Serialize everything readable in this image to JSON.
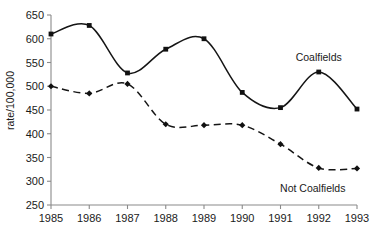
{
  "chart_data": {
    "type": "line",
    "title": "",
    "xlabel": "",
    "ylabel": "rate/100,000",
    "x": [
      1985,
      1986,
      1987,
      1988,
      1989,
      1990,
      1991,
      1992,
      1993
    ],
    "xtick_labels": [
      "1985",
      "1986",
      "1987",
      "1988",
      "1989",
      "1990",
      "1991",
      "1992",
      "1993"
    ],
    "ytick_labels": [
      "250",
      "300",
      "350",
      "400",
      "450",
      "500",
      "550",
      "600",
      "650"
    ],
    "yticks": [
      250,
      300,
      350,
      400,
      450,
      500,
      550,
      600,
      650
    ],
    "ylim": [
      250,
      650
    ],
    "xlim": [
      1985,
      1993
    ],
    "grid": false,
    "legend_position": "inline-annotations",
    "series": [
      {
        "name": "Coalfields",
        "style": "solid",
        "marker": "square",
        "label_text": "Coalfields",
        "values": [
          610,
          628,
          528,
          578,
          600,
          487,
          455,
          530,
          452
        ]
      },
      {
        "name": "Not Coalfields",
        "style": "dashed",
        "marker": "diamond",
        "label_text": "Not Coalfields",
        "values": [
          500,
          485,
          505,
          420,
          418,
          418,
          378,
          328,
          327
        ]
      }
    ],
    "annotations": [
      {
        "text": "Coalfields",
        "series": "Coalfields"
      },
      {
        "text": "Not Coalfields",
        "series": "Not Coalfields"
      }
    ],
    "colors": {
      "line": "#151515",
      "axis": "#8a8a8a",
      "text": "#1a1a1a",
      "background": "#ffffff"
    }
  }
}
